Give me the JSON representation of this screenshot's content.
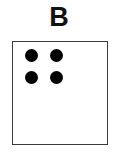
{
  "panel": {
    "label": "B",
    "background_color": "#ffffff"
  },
  "stimulus_box": {
    "border_color": "#3b3b3b",
    "fill_color": "#ffffff",
    "border_width_px": 1.5,
    "x": 12,
    "y": 41,
    "width": 96,
    "height": 104
  },
  "dots": {
    "count": 4,
    "color": "#000000",
    "shape": "circle",
    "diameter_px": 13,
    "arrangement": "2x2-grid-upper-left",
    "items": [
      {
        "name": "dot-top-left",
        "cx": 18,
        "cy": 13
      },
      {
        "name": "dot-top-right",
        "cx": 43,
        "cy": 13
      },
      {
        "name": "dot-bottom-left",
        "cx": 18,
        "cy": 35
      },
      {
        "name": "dot-bottom-right",
        "cx": 43,
        "cy": 35
      }
    ]
  }
}
